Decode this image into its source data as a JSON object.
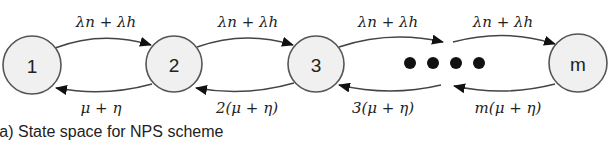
{
  "diagram": {
    "type": "state-transition-chain",
    "nodes": [
      {
        "id": "1",
        "label": "1",
        "cx": 32,
        "cy": 65
      },
      {
        "id": "2",
        "label": "2",
        "cx": 174,
        "cy": 64
      },
      {
        "id": "3",
        "label": "3",
        "cx": 316,
        "cy": 64
      },
      {
        "id": "m",
        "label": "m",
        "cx": 578,
        "cy": 63
      }
    ],
    "ellipsis_dots": 4,
    "forward_edges": [
      {
        "from": "1",
        "to": "2",
        "label": "λn + λh"
      },
      {
        "from": "2",
        "to": "3",
        "label": "λn + λh"
      },
      {
        "from": "3",
        "to": "…",
        "label": "λn + λh"
      },
      {
        "from": "…",
        "to": "m",
        "label": "λn + λh"
      }
    ],
    "backward_edges": [
      {
        "from": "2",
        "to": "1",
        "label": "μ + η"
      },
      {
        "from": "3",
        "to": "2",
        "label": "2(μ + η)"
      },
      {
        "from": "…",
        "to": "3",
        "label": "3(μ + η)"
      },
      {
        "from": "m",
        "to": "…",
        "label": "m(μ + η)"
      }
    ],
    "colors": {
      "node_fill": "#f0f0f0",
      "node_stroke": "#555555",
      "edge": "#444444",
      "text": "#222222"
    }
  },
  "caption": "(a)  State space for NPS scheme"
}
